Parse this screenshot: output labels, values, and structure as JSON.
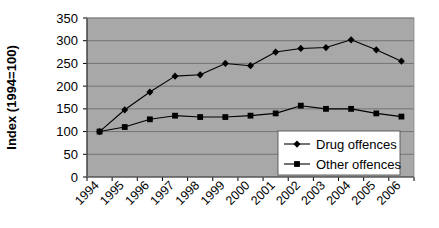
{
  "chart_data": {
    "type": "line",
    "title": "",
    "xlabel": "",
    "ylabel": "Index (1994=100)",
    "categories": [
      "1994",
      "1995",
      "1996",
      "1997",
      "1998",
      "1999",
      "2000",
      "2001",
      "2002",
      "2003",
      "2004",
      "2005",
      "2006"
    ],
    "series": [
      {
        "name": "Drug offences",
        "marker": "diamond",
        "values": [
          100,
          148,
          187,
          222,
          225,
          250,
          245,
          275,
          283,
          285,
          302,
          280,
          255
        ]
      },
      {
        "name": "Other offences",
        "marker": "square",
        "values": [
          100,
          110,
          127,
          135,
          132,
          132,
          135,
          140,
          157,
          150,
          150,
          140,
          133
        ]
      }
    ],
    "ylim": [
      0,
      350
    ],
    "ytick_step": 50,
    "yticks": [
      "0",
      "50",
      "100",
      "150",
      "200",
      "250",
      "300",
      "350"
    ],
    "grid": "horizontal",
    "legend_position": "inside-bottom-right",
    "plot_background": "#a8a8a8",
    "gridline_color": "#6e6e6e",
    "series_color": "#000000",
    "legend_background": "#ffffff",
    "axis_color": "#000000"
  }
}
